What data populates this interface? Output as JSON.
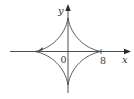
{
  "figure": {
    "type": "astroid",
    "equation_hint": "x^(2/3) + y^(2/3) = 8^(2/3)",
    "labels": {
      "x_axis": "x",
      "y_axis": "y",
      "origin": "0",
      "x_intercept": "8"
    },
    "colors": {
      "axis": "#3a3a3a",
      "curve": "#4a4a4a",
      "text": "#333333"
    },
    "cusps": {
      "right": 8,
      "left": -8,
      "top": 8,
      "bottom": -8
    }
  }
}
